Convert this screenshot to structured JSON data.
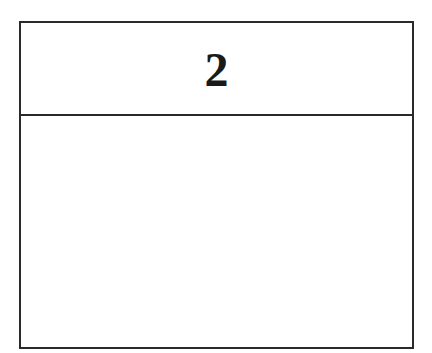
{
  "card": {
    "header_label": "2",
    "body_content": ""
  },
  "colors": {
    "border": "#2a2a2a",
    "text": "#1a1a1a",
    "background": "#ffffff"
  }
}
